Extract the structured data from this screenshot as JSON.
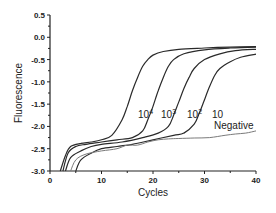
{
  "chart_data": {
    "type": "line",
    "title": "",
    "xlabel": "Cycles",
    "ylabel": "Fluorescence",
    "xlim": [
      0,
      40
    ],
    "ylim": [
      -3.0,
      0.5
    ],
    "xticks": [
      0,
      10,
      20,
      30,
      40
    ],
    "xtick_labels": [
      "0",
      "10",
      "20",
      "30",
      "40"
    ],
    "yticks": [
      0.5,
      0.0,
      -0.5,
      -1.0,
      -1.5,
      -2.0,
      -2.5,
      -3.0
    ],
    "ytick_labels": [
      "0.5",
      "0.0",
      "-0.5",
      "-1.0",
      "-1.5",
      "-2.0",
      "-2.5",
      "-3.0"
    ],
    "grid": false,
    "legend": "inline labels",
    "series": [
      {
        "name": "10^4",
        "label_base": "10",
        "label_exp": "4",
        "x": [
          2,
          3,
          4,
          6,
          8,
          10,
          12,
          14,
          15,
          16,
          17,
          18,
          19,
          20,
          22,
          25,
          30,
          35,
          40
        ],
        "y": [
          -3.0,
          -2.65,
          -2.45,
          -2.38,
          -2.35,
          -2.3,
          -2.2,
          -1.85,
          -1.55,
          -1.2,
          -0.9,
          -0.65,
          -0.5,
          -0.4,
          -0.32,
          -0.27,
          -0.24,
          -0.22,
          -0.21
        ]
      },
      {
        "name": "10^3",
        "label_base": "10",
        "label_exp": "3",
        "x": [
          2.5,
          3.5,
          5,
          7,
          10,
          13,
          16,
          18,
          19,
          20,
          21,
          22,
          23,
          24,
          26,
          30,
          35,
          40
        ],
        "y": [
          -3.0,
          -2.6,
          -2.45,
          -2.4,
          -2.35,
          -2.3,
          -2.25,
          -2.1,
          -1.85,
          -1.55,
          -1.2,
          -0.9,
          -0.65,
          -0.5,
          -0.37,
          -0.28,
          -0.24,
          -0.22
        ]
      },
      {
        "name": "10^2",
        "label_base": "10",
        "label_exp": "2",
        "x": [
          3,
          4,
          6,
          8,
          10,
          14,
          18,
          21,
          23,
          24,
          25,
          26,
          27,
          28,
          30,
          33,
          36,
          40
        ],
        "y": [
          -3.0,
          -2.7,
          -2.55,
          -2.45,
          -2.4,
          -2.35,
          -2.25,
          -2.15,
          -2.0,
          -1.75,
          -1.45,
          -1.15,
          -0.9,
          -0.7,
          -0.5,
          -0.37,
          -0.3,
          -0.27
        ]
      },
      {
        "name": "10",
        "label_base": "10",
        "label_exp": "",
        "x": [
          5,
          6,
          8,
          10,
          13,
          16,
          20,
          24,
          26,
          28,
          29,
          30,
          31,
          32,
          33,
          35,
          37,
          40
        ],
        "y": [
          -3.0,
          -2.75,
          -2.6,
          -2.5,
          -2.45,
          -2.4,
          -2.3,
          -2.2,
          -2.15,
          -1.95,
          -1.7,
          -1.4,
          -1.1,
          -0.85,
          -0.7,
          -0.55,
          -0.45,
          -0.38
        ]
      },
      {
        "name": "Negative",
        "label_base": "Negative",
        "label_exp": "",
        "x": [
          4,
          5,
          7,
          10,
          13,
          15,
          17,
          19,
          21,
          23,
          25,
          28,
          31,
          34,
          36,
          38,
          40
        ],
        "y": [
          -3.0,
          -2.75,
          -2.62,
          -2.55,
          -2.5,
          -2.42,
          -2.42,
          -2.35,
          -2.3,
          -2.28,
          -2.27,
          -2.26,
          -2.25,
          -2.2,
          -2.17,
          -2.15,
          -2.1
        ]
      }
    ],
    "annotations": [
      {
        "text": "10^4",
        "x": 16.5,
        "y": -1.0
      },
      {
        "text": "10^3",
        "x": 21.3,
        "y": -1.0
      },
      {
        "text": "10^2",
        "x": 27.5,
        "y": -1.0
      },
      {
        "text": "10",
        "x": 31.8,
        "y": -1.0
      },
      {
        "text": "Negative",
        "x": 37,
        "y": -1.75
      }
    ]
  },
  "labels": {
    "xlabel": "Cycles",
    "ylabel": "Fluorescence",
    "s4_base": "10",
    "s4_exp": "4",
    "s3_base": "10",
    "s3_exp": "3",
    "s2_base": "10",
    "s2_exp": "2",
    "s1_base": "10",
    "negative": "Negative"
  },
  "colors": {
    "curve_dark": "#2a2a2a",
    "curve_negative": "#7a7a7a",
    "axis": "#222222"
  }
}
